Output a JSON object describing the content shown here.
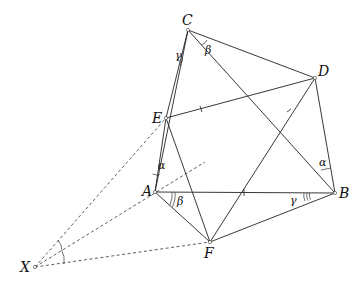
{
  "figure": {
    "points": {
      "A": {
        "label": "A",
        "x": 155,
        "y": 192
      },
      "B": {
        "label": "B",
        "x": 335,
        "y": 193
      },
      "C": {
        "label": "C",
        "x": 188,
        "y": 30
      },
      "D": {
        "label": "D",
        "x": 315,
        "y": 78
      },
      "E": {
        "label": "E",
        "x": 166,
        "y": 118
      },
      "F": {
        "label": "F",
        "x": 210,
        "y": 242
      },
      "X": {
        "label": "X",
        "x": 35,
        "y": 267
      }
    },
    "angle_labels": {
      "alpha_A": "α",
      "alpha_B": "α",
      "beta_A": "β",
      "beta_C": "β",
      "gamma_C": "γ",
      "gamma_B": "γ"
    },
    "segments": [
      [
        "C",
        "E"
      ],
      [
        "E",
        "A"
      ],
      [
        "A",
        "F"
      ],
      [
        "F",
        "B"
      ],
      [
        "B",
        "D"
      ],
      [
        "D",
        "C"
      ],
      [
        "C",
        "A"
      ],
      [
        "C",
        "B"
      ],
      [
        "E",
        "D"
      ],
      [
        "E",
        "F"
      ],
      [
        "A",
        "B"
      ],
      [
        "F",
        "D"
      ]
    ],
    "dashed_segments": [
      [
        "X",
        "E"
      ],
      [
        "X",
        "A"
      ],
      [
        "X",
        "F"
      ]
    ]
  }
}
